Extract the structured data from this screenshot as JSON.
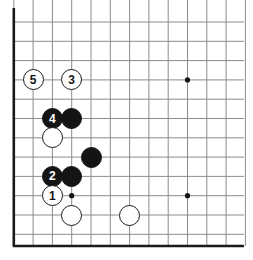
{
  "figure": {
    "kind": "go-board-diagram",
    "board_region": "bottom-left corner",
    "background_color": "#ffffff",
    "grid_line_color": "#8c8c8c",
    "edge_line_color": "#1a1a1a",
    "black_stone_color": "#141414",
    "white_stone_color": "#ffffff",
    "white_stone_border_color": "#1a1a1a",
    "star_point_color": "#141414"
  },
  "geometry": {
    "origin_x": 13.8,
    "origin_y": 22.0,
    "spacing": 19.3,
    "columns": 13,
    "rows": 12,
    "stone_diameter": 21,
    "edge_left_x": 13.8,
    "edge_bottom_y": 246.0
  },
  "grid": {
    "left_edge_thick": true,
    "bottom_edge_thick": true,
    "top_edge_visible": false,
    "right_edge_visible": false
  },
  "star_points": [
    {
      "name": "star-point-corner",
      "col": 3,
      "row": 9
    },
    {
      "name": "star-point-side-upper",
      "col": 9,
      "row": 3
    },
    {
      "name": "star-point-side-lower",
      "col": 9,
      "row": 9
    }
  ],
  "stones": [
    {
      "id": "w5",
      "color": "white",
      "label": "5",
      "col": 1,
      "row": 3
    },
    {
      "id": "w3",
      "color": "white",
      "label": "3",
      "col": 3,
      "row": 3
    },
    {
      "id": "b4",
      "color": "black",
      "label": "4",
      "col": 2,
      "row": 5
    },
    {
      "id": "b-a",
      "color": "black",
      "label": "",
      "col": 3,
      "row": 5
    },
    {
      "id": "w-a",
      "color": "white",
      "label": "",
      "col": 2,
      "row": 6
    },
    {
      "id": "b-b",
      "color": "black",
      "label": "",
      "col": 4,
      "row": 7
    },
    {
      "id": "b2",
      "color": "black",
      "label": "2",
      "col": 2,
      "row": 8
    },
    {
      "id": "b-c",
      "color": "black",
      "label": "",
      "col": 3,
      "row": 8
    },
    {
      "id": "w1",
      "color": "white",
      "label": "1",
      "col": 2,
      "row": 9
    },
    {
      "id": "w-b",
      "color": "white",
      "label": "",
      "col": 3,
      "row": 10
    },
    {
      "id": "w-c",
      "color": "white",
      "label": "",
      "col": 6,
      "row": 10
    }
  ],
  "move_sequence": [
    {
      "number": "1",
      "color": "white"
    },
    {
      "number": "2",
      "color": "black"
    },
    {
      "number": "3",
      "color": "white"
    },
    {
      "number": "4",
      "color": "black"
    },
    {
      "number": "5",
      "color": "white"
    }
  ]
}
